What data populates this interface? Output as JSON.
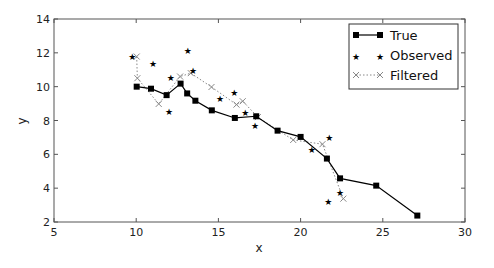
{
  "chart_data": {
    "type": "line",
    "title": "",
    "xlabel": "x",
    "ylabel": "y",
    "xlim": [
      5,
      30
    ],
    "ylim": [
      2,
      14
    ],
    "xticks": [
      5,
      10,
      15,
      20,
      25,
      30
    ],
    "yticks": [
      2,
      4,
      6,
      8,
      10,
      12,
      14
    ],
    "grid": false,
    "legend_position": "upper right",
    "series": [
      {
        "name": "True",
        "style": "solid line with square markers",
        "color": "#000000",
        "points": [
          [
            10.03,
            10.0
          ],
          [
            10.9,
            9.88
          ],
          [
            11.85,
            9.5
          ],
          [
            12.7,
            10.18
          ],
          [
            13.1,
            9.6
          ],
          [
            13.6,
            9.17
          ],
          [
            14.6,
            8.6
          ],
          [
            16.0,
            8.15
          ],
          [
            17.3,
            8.25
          ],
          [
            18.6,
            7.4
          ],
          [
            20.0,
            7.03
          ],
          [
            21.6,
            5.75
          ],
          [
            22.4,
            4.58
          ],
          [
            24.6,
            4.15
          ],
          [
            27.1,
            2.38
          ]
        ]
      },
      {
        "name": "Observed",
        "style": "star markers, no line",
        "color": "#000000",
        "points": [
          [
            9.76,
            11.78
          ],
          [
            11.02,
            11.33
          ],
          [
            13.14,
            12.13
          ],
          [
            12.1,
            10.53
          ],
          [
            13.45,
            10.93
          ],
          [
            12.0,
            8.49
          ],
          [
            15.1,
            9.3
          ],
          [
            15.97,
            9.63
          ],
          [
            16.64,
            8.45
          ],
          [
            17.23,
            7.65
          ],
          [
            20.68,
            6.25
          ],
          [
            21.75,
            6.94
          ],
          [
            22.4,
            3.71
          ],
          [
            21.69,
            3.16
          ]
        ]
      },
      {
        "name": "Filtered",
        "style": "dotted line with x markers",
        "color": "#888888",
        "points": [
          [
            10.03,
            11.78
          ],
          [
            10.07,
            10.5
          ],
          [
            11.37,
            8.98
          ],
          [
            12.67,
            10.6
          ],
          [
            13.32,
            10.8
          ],
          [
            14.58,
            9.98
          ],
          [
            16.1,
            8.94
          ],
          [
            16.48,
            9.14
          ],
          [
            17.4,
            8.2
          ],
          [
            19.55,
            6.85
          ],
          [
            21.33,
            6.6
          ],
          [
            22.6,
            3.38
          ]
        ]
      }
    ]
  },
  "legend": {
    "items": [
      {
        "label": "True"
      },
      {
        "label": "Observed"
      },
      {
        "label": "Filtered"
      }
    ]
  }
}
